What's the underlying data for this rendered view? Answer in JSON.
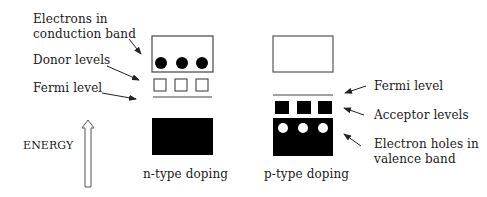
{
  "diagram": {
    "energy_axis": {
      "label": "ENERGY",
      "direction": "up"
    },
    "n_type": {
      "caption": "n-type doping",
      "labels": {
        "conduction": "Electrons in conduction band",
        "conduction_line1": "Electrons in",
        "conduction_line2": "conduction band",
        "donor": "Donor levels",
        "fermi": "Fermi level"
      },
      "electron_count": 3,
      "donor_level_count": 3
    },
    "p_type": {
      "caption": "p-type doping",
      "labels": {
        "fermi": "Fermi level",
        "acceptor": "Acceptor levels",
        "holes": "Electron holes in valence band",
        "holes_line1": "Electron holes in",
        "holes_line2": "valence band"
      },
      "hole_count": 3,
      "acceptor_level_count": 3
    },
    "colors": {
      "band_fill": "#000000",
      "outline": "#555555",
      "background": "#ffffff"
    }
  }
}
